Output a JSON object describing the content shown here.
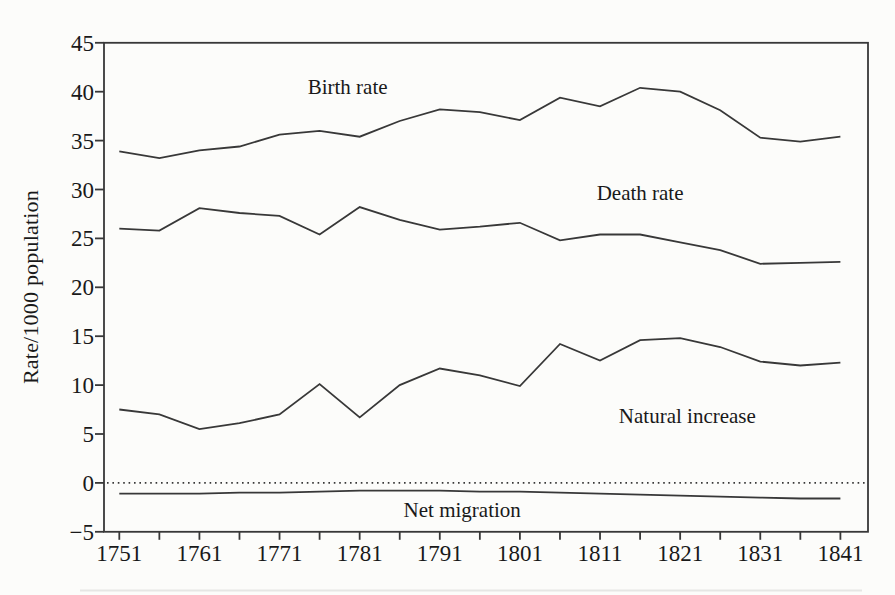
{
  "page": {
    "background": "#fcfcfa",
    "ink_color": "#383838",
    "text_color": "#191919"
  },
  "chart_data": {
    "type": "line",
    "title": "",
    "xlabel": "",
    "ylabel": "Rate/1000 population",
    "x": [
      1751,
      1756,
      1761,
      1766,
      1771,
      1776,
      1781,
      1786,
      1791,
      1796,
      1801,
      1806,
      1811,
      1816,
      1821,
      1826,
      1831,
      1836,
      1841
    ],
    "series": [
      {
        "name": "Birth rate",
        "values": [
          33.9,
          33.2,
          34.0,
          34.4,
          35.6,
          36.0,
          35.4,
          37.0,
          38.2,
          37.9,
          37.1,
          39.4,
          38.5,
          40.4,
          40.0,
          38.1,
          35.3,
          34.9,
          35.4
        ]
      },
      {
        "name": "Death rate",
        "values": [
          26.0,
          25.8,
          28.1,
          27.6,
          27.3,
          25.4,
          28.2,
          26.9,
          25.9,
          26.2,
          26.6,
          24.8,
          25.4,
          25.4,
          24.6,
          23.8,
          22.4,
          22.5,
          22.6
        ]
      },
      {
        "name": "Natural increase",
        "values": [
          7.5,
          7.0,
          5.5,
          6.1,
          7.0,
          10.1,
          6.7,
          10.0,
          11.7,
          11.0,
          9.9,
          14.2,
          12.5,
          14.6,
          14.8,
          13.9,
          12.4,
          12.0,
          12.3
        ]
      },
      {
        "name": "Net migration",
        "values": [
          -1.1,
          -1.1,
          -1.1,
          -1.0,
          -1.0,
          -0.9,
          -0.8,
          -0.8,
          -0.8,
          -0.9,
          -0.9,
          -1.0,
          -1.1,
          -1.2,
          -1.3,
          -1.4,
          -1.5,
          -1.6,
          -1.6
        ]
      }
    ],
    "annotations": [
      {
        "label": "Birth rate",
        "year": 1779.5,
        "value": 40.5
      },
      {
        "label": "Death rate",
        "year": 1816.0,
        "value": 29.6
      },
      {
        "label": "Natural increase",
        "year": 1821.9,
        "value": 6.8
      },
      {
        "label": "Net migration",
        "year": 1793.8,
        "value": -2.8
      }
    ],
    "axes": {
      "ylim": [
        -5,
        45
      ],
      "yticks": [
        45,
        40,
        35,
        30,
        25,
        20,
        15,
        10,
        5,
        0,
        -5
      ],
      "xlim": [
        1751,
        1841
      ],
      "xtick_minor_step": 5,
      "xtick_labels": [
        1751,
        1761,
        1771,
        1781,
        1791,
        1801,
        1811,
        1821,
        1831,
        1841
      ],
      "zero_reference_line": "dotted",
      "grid": false,
      "legend": "inline-annotations"
    }
  }
}
